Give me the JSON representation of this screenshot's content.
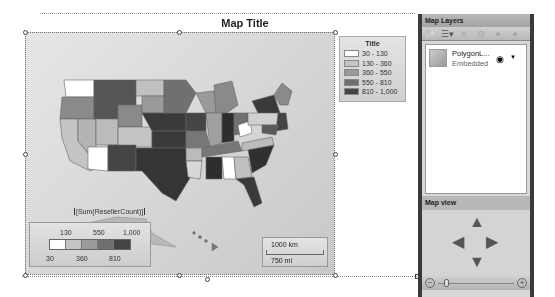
{
  "map": {
    "title": "Map Title",
    "field_label": "[Sum(ResellerCount)]"
  },
  "legend": {
    "title": "Title",
    "items": [
      {
        "label": "30 - 130",
        "color": "#ffffff"
      },
      {
        "label": "130 - 360",
        "color": "#c4c4c4"
      },
      {
        "label": "360 - 550",
        "color": "#9a9a9a"
      },
      {
        "label": "550 - 810",
        "color": "#707070"
      },
      {
        "label": "810 - 1,000",
        "color": "#444444"
      }
    ]
  },
  "color_scale": {
    "top_labels": [
      "130",
      "550",
      "1,000"
    ],
    "bottom_labels": [
      "30",
      "360",
      "810"
    ],
    "colors": [
      "#ffffff",
      "#c4c4c4",
      "#9a9a9a",
      "#707070",
      "#444444"
    ]
  },
  "distance_scale": {
    "km": "1000 km",
    "mi": "750 mi"
  },
  "panel": {
    "title": "Map Layers",
    "toolbar": {
      "wizard": "✨",
      "add_layer": "☰▾",
      "delete": "✕",
      "properties": "⚙",
      "move_up": "●",
      "move_down": "●"
    },
    "layers": [
      {
        "name": "PolygonL...",
        "source": "Embedded",
        "visibility_icon": "◉",
        "menu_icon": "▼"
      }
    ],
    "map_view": {
      "title": "Map view",
      "up": "▲",
      "down": "▼",
      "left": "◀",
      "right": "▶",
      "zoom_out": "−",
      "zoom_in": "+"
    }
  }
}
